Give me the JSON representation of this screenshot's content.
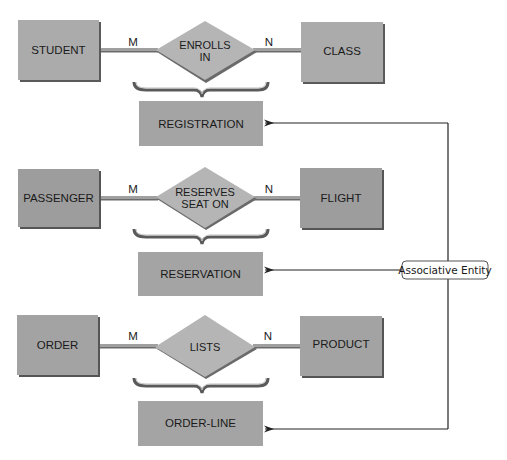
{
  "diagram": {
    "type": "ER diagram - associative entities",
    "colors": {
      "entity_fill": "#a9a9a9",
      "entity_fill_dark": "#9c9c9c",
      "entity_shadow": "#5a5a5a",
      "relationship_fill": "#b4b4b4",
      "relationship_shadow": "#6a6a6a",
      "connector": "#9a9a9a",
      "brace": "#5c5c5c",
      "arrow_line": "#222222",
      "label_border": "#555555"
    },
    "rows": [
      {
        "left_entity": "STUDENT",
        "relationship_line1": "ENROLLS",
        "relationship_line2": "IN",
        "right_entity": "CLASS",
        "left_cardinality": "M",
        "right_cardinality": "N",
        "associative_entity": "REGISTRATION"
      },
      {
        "left_entity": "PASSENGER",
        "relationship_line1": "RESERVES",
        "relationship_line2": "SEAT ON",
        "right_entity": "FLIGHT",
        "left_cardinality": "M",
        "right_cardinality": "N",
        "associative_entity": "RESERVATION"
      },
      {
        "left_entity": "ORDER",
        "relationship_line1": "LISTS",
        "relationship_line2": "",
        "right_entity": "PRODUCT",
        "left_cardinality": "M",
        "right_cardinality": "N",
        "associative_entity": "ORDER-LINE"
      }
    ],
    "callout_label": "Associative Entity"
  }
}
